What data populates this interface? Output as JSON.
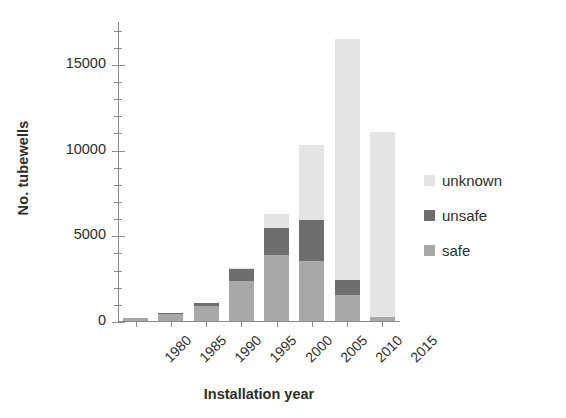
{
  "chart_data": {
    "type": "bar",
    "subtype": "stacked-bar",
    "title": "",
    "xlabel": "Installation year",
    "ylabel": "No. tubewells",
    "categories": [
      "1980",
      "1985",
      "1990",
      "1995",
      "2000",
      "2005",
      "2010",
      "2015"
    ],
    "series": [
      {
        "name": "safe",
        "color": "#a8a8a8",
        "values": [
          150,
          430,
          850,
          2350,
          3850,
          3500,
          1500,
          250
        ]
      },
      {
        "name": "unsafe",
        "color": "#6e6e6e",
        "values": [
          0,
          30,
          200,
          700,
          1550,
          2400,
          900,
          0
        ]
      },
      {
        "name": "unknown",
        "color": "#e4e4e4",
        "values": [
          0,
          0,
          0,
          50,
          850,
          4350,
          14050,
          10750
        ]
      }
    ],
    "totals": [
      150,
      460,
      1050,
      3100,
      6250,
      10250,
      16450,
      11000
    ],
    "ylim": [
      0,
      17500
    ],
    "ytick_major": [
      0,
      5000,
      10000,
      15000
    ],
    "ytick_major_labels": [
      "0",
      "5000",
      "10000",
      "15000"
    ],
    "ytick_minor_step": 1000,
    "grid": false,
    "legend_position": "right",
    "legend_order": [
      "unknown",
      "unsafe",
      "safe"
    ]
  },
  "axes": {
    "y_title": "No. tubewells",
    "x_title": "Installation year"
  },
  "legend": {
    "items": [
      {
        "label": "unknown",
        "color": "#e4e4e4"
      },
      {
        "label": "unsafe",
        "color": "#6e6e6e"
      },
      {
        "label": "safe",
        "color": "#a8a8a8"
      }
    ]
  },
  "colors": {
    "axis": "#8a8a8a",
    "text": "#2d2d2d",
    "background": "#ffffff"
  }
}
